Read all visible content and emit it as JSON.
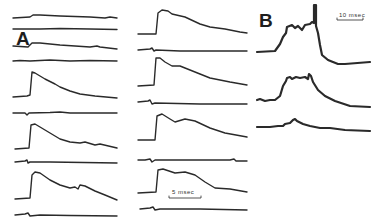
{
  "figure": {
    "panels": [
      {
        "label": "A",
        "scale_bar": "5 msec",
        "columns": 2,
        "traces_left": 10,
        "traces_right": 8
      },
      {
        "label": "B",
        "scale_bar": "10 msec",
        "traces": 3
      }
    ]
  }
}
